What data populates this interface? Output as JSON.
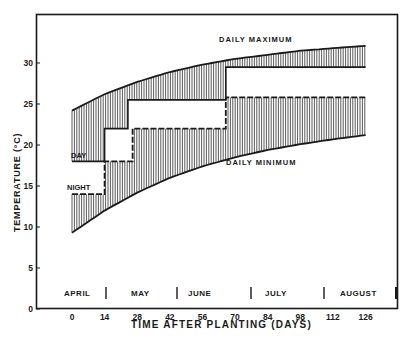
{
  "chart_data": {
    "type": "line",
    "title": "",
    "xlabel": "TIME AFTER PLANTING (DAYS)",
    "ylabel": "TEMPERATURE (°C)",
    "xlim": [
      -10,
      140
    ],
    "ylim": [
      0,
      37
    ],
    "grid": false,
    "x_ticks": [
      0,
      14,
      28,
      42,
      56,
      70,
      84,
      98,
      112,
      126
    ],
    "y_ticks": [
      0,
      5,
      10,
      15,
      20,
      25,
      30
    ],
    "months": [
      "APRIL",
      "MAY",
      "JUNE",
      "JULY",
      "AUGUST"
    ],
    "month_boundaries_days": [
      14,
      45,
      75,
      105,
      137
    ],
    "series": [
      {
        "name": "DAILY MAXIMUM",
        "style": "curve",
        "x": [
          0,
          14,
          28,
          42,
          56,
          70,
          84,
          98,
          112,
          126
        ],
        "values": [
          24.2,
          26.2,
          27.7,
          28.9,
          29.8,
          30.5,
          31.0,
          31.5,
          31.8,
          32.1
        ]
      },
      {
        "name": "DAILY MINIMUM",
        "style": "curve",
        "x": [
          0,
          14,
          28,
          42,
          56,
          70,
          84,
          98,
          112,
          126
        ],
        "values": [
          9.3,
          12.0,
          14.2,
          16.0,
          17.4,
          18.5,
          19.4,
          20.1,
          20.7,
          21.2
        ]
      },
      {
        "name": "DAY",
        "style": "step-solid",
        "x": [
          0,
          14,
          14,
          24,
          24,
          66,
          66,
          126
        ],
        "values": [
          18,
          18,
          22,
          22,
          25.5,
          25.5,
          29.5,
          29.5
        ]
      },
      {
        "name": "NIGHT",
        "style": "step-dashed",
        "x": [
          0,
          14,
          14,
          26,
          26,
          66,
          66,
          126
        ],
        "values": [
          14,
          14,
          18,
          18,
          22,
          22,
          25.8,
          25.8
        ]
      }
    ],
    "annotations": [
      "DAILY MAXIMUM",
      "DAILY MINIMUM",
      "DAY",
      "NIGHT"
    ],
    "hatching": "vertical lines between max curve and day setpoint, and between night setpoint and min curve"
  },
  "labels": {
    "ylabel": "TEMPERATURE (°C)",
    "xlabel": "TIME AFTER PLANTING (DAYS)",
    "max": "DAILY MAXIMUM",
    "min": "DAILY MINIMUM",
    "day": "DAY",
    "night": "NIGHT"
  },
  "ticks": {
    "y": [
      "0",
      "5",
      "10",
      "15",
      "20",
      "25",
      "30"
    ],
    "x": [
      "0",
      "14",
      "28",
      "42",
      "56",
      "70",
      "84",
      "98",
      "112",
      "126"
    ]
  },
  "months": [
    "APRIL",
    "MAY",
    "JUNE",
    "JULY",
    "AUGUST"
  ]
}
